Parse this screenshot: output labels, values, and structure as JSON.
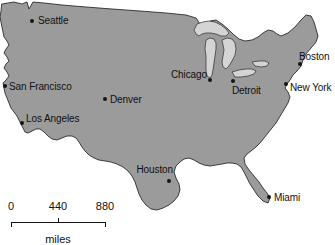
{
  "figure": {
    "type": "reference-map",
    "region": "Contiguous United States",
    "background_color": "#ffffff",
    "land_fill_color": "#9b9b9b",
    "lake_fill_color": "#d4d4d4",
    "outline_color": "#2b2b2b",
    "label_color": "#111111",
    "dot_color": "#141414"
  },
  "cities": [
    {
      "name": "Seattle",
      "x": 32,
      "y": 21,
      "label_x": 38,
      "label_y": 20,
      "anchor": "left"
    },
    {
      "name": "San Francisco",
      "x": 5,
      "y": 86,
      "label_x": 9,
      "label_y": 86,
      "anchor": "left"
    },
    {
      "name": "Los Angeles",
      "x": 22,
      "y": 123,
      "label_x": 26,
      "label_y": 118,
      "anchor": "left"
    },
    {
      "name": "Denver",
      "x": 105,
      "y": 99,
      "label_x": 110,
      "label_y": 99,
      "anchor": "left"
    },
    {
      "name": "Chicago",
      "x": 210,
      "y": 80,
      "label_x": 207,
      "label_y": 74,
      "anchor": "right"
    },
    {
      "name": "Houston",
      "x": 169,
      "y": 181,
      "label_x": 173,
      "label_y": 169,
      "anchor": "right"
    },
    {
      "name": "Detroit",
      "x": 233,
      "y": 81,
      "label_x": 232,
      "label_y": 90,
      "anchor": "left"
    },
    {
      "name": "New York",
      "x": 286,
      "y": 84,
      "label_x": 290,
      "label_y": 87,
      "anchor": "left"
    },
    {
      "name": "Boston",
      "x": 300,
      "y": 64,
      "label_x": 299,
      "label_y": 56,
      "anchor": "left"
    },
    {
      "name": "Miami",
      "x": 269,
      "y": 197,
      "label_x": 274,
      "label_y": 197,
      "anchor": "left"
    }
  ],
  "scale_bar": {
    "units_label": "miles",
    "ticks": [
      {
        "label": "0",
        "x": 11
      },
      {
        "label": "440",
        "x": 58
      },
      {
        "label": "880",
        "x": 105
      }
    ],
    "bar_y": 222,
    "label_y": 212,
    "units_y": 233,
    "tick_height": 5,
    "line_color": "#111111"
  },
  "chart_data": {
    "type": "map",
    "title": "",
    "projection_note": "Contiguous United States outline with Great Lakes",
    "markers": [
      "Seattle",
      "San Francisco",
      "Los Angeles",
      "Denver",
      "Chicago",
      "Houston",
      "Detroit",
      "New York",
      "Boston",
      "Miami"
    ],
    "scale_values": [
      0,
      440,
      880
    ],
    "scale_units": "miles"
  }
}
